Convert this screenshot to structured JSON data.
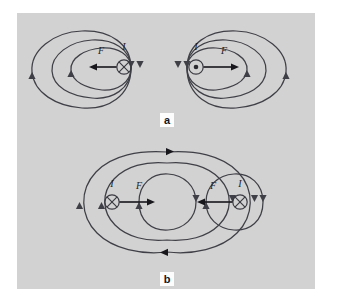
{
  "figure": {
    "background_color": "#ffffff",
    "panel_color": "#d2d2d2",
    "line_color": "#3f3f47",
    "arrow_color": "#17171c",
    "panels": [
      {
        "letter": "a",
        "description": "Antiparallel currents repel",
        "conductors": [
          {
            "position": "left",
            "current_label": "I",
            "current_direction_symbol": "x-in-circle",
            "force_label": "F",
            "force_direction": "left"
          },
          {
            "position": "right",
            "current_label": "I",
            "current_direction_symbol": "dot-in-circle",
            "force_label": "F",
            "force_direction": "right"
          }
        ]
      },
      {
        "letter": "b",
        "description": "Parallel currents attract",
        "conductors": [
          {
            "position": "left",
            "current_label": "I",
            "current_direction_symbol": "x-in-circle",
            "force_label": "F",
            "force_direction": "right"
          },
          {
            "position": "right",
            "current_label": "I",
            "current_direction_symbol": "x-in-circle",
            "force_label": "F",
            "force_direction": "left"
          }
        ]
      }
    ]
  }
}
